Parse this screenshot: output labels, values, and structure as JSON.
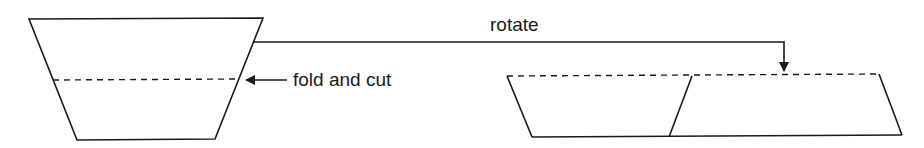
{
  "diagram": {
    "labels": {
      "fold_and_cut": "fold and cut",
      "rotate": "rotate"
    },
    "colors": {
      "stroke": "#1a1a1a",
      "background": "#ffffff"
    },
    "shapes": {
      "trapezoid": {
        "points": [
          [
            29,
            19
          ],
          [
            263,
            18
          ],
          [
            215,
            139
          ],
          [
            77,
            140
          ]
        ],
        "fold_line": [
          [
            53,
            80
          ],
          [
            239,
            79
          ]
        ]
      },
      "parallelogram_pair": {
        "dashed_top": [
          [
            507,
            76
          ],
          [
            879,
            74
          ]
        ],
        "left_edge": [
          [
            507,
            76
          ],
          [
            532,
            137
          ]
        ],
        "middle_edge": [
          [
            692,
            76
          ],
          [
            669,
            137
          ]
        ],
        "right_edge": [
          [
            879,
            74
          ],
          [
            902,
            135
          ]
        ],
        "bottom": [
          [
            532,
            137
          ],
          [
            902,
            135
          ]
        ]
      }
    },
    "arrows": {
      "fold_arrow": {
        "from": [
          287,
          80
        ],
        "to": [
          243,
          80
        ]
      },
      "rotate_arrow": {
        "path": [
          [
            253,
            42
          ],
          [
            784,
            42
          ],
          [
            784,
            74
          ]
        ]
      }
    }
  }
}
